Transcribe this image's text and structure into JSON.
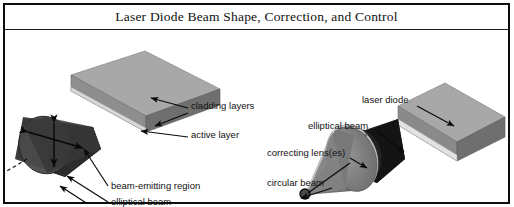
{
  "figure": {
    "title": "Laser Diode Beam Shape, Correction, and Control",
    "background_color": "#ffffff",
    "border_color": "#0d0d0d"
  },
  "palette": {
    "slab_top": "#a8a8a8",
    "slab_front": "#8e8e8e",
    "slab_side": "#6f6f6f",
    "beam_dark": "#3a3a3a",
    "beam_dark_face": "#2a2a2a",
    "cone_grey": "#808080",
    "lens_light": "#e6e6e6",
    "line_color": "#0a0a0a",
    "text_color": "#111111"
  },
  "left_diagram": {
    "name": "uncorrected-laser-diode",
    "labels": [
      {
        "id": "cladding-layers",
        "text": "cladding layers",
        "x": 186,
        "y": 77
      },
      {
        "id": "active-layer",
        "text": "active layer",
        "x": 186,
        "y": 105
      },
      {
        "id": "beam-emitting-region",
        "text": "beam-emitting region",
        "x": 106,
        "y": 158
      },
      {
        "id": "elliptical-beam",
        "text": "elliptical beam",
        "x": 106,
        "y": 173
      },
      {
        "id": "beam-axes",
        "text": "beam axes",
        "x": 106,
        "y": 188
      }
    ]
  },
  "right_diagram": {
    "name": "corrected-laser-diode-with-lens",
    "labels": [
      {
        "id": "laser-diode",
        "text": "laser diode",
        "x": 360,
        "y": 71
      },
      {
        "id": "elliptical-beam-right",
        "text": "elliptical beam",
        "x": 305,
        "y": 96
      },
      {
        "id": "correcting-lenses",
        "text": "correcting lens(es)",
        "x": 269,
        "y": 123
      },
      {
        "id": "circular-beam",
        "text": "circular beam",
        "x": 269,
        "y": 153
      }
    ]
  }
}
